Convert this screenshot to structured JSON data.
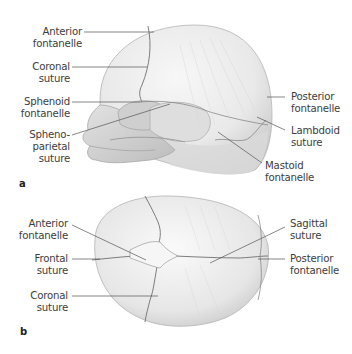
{
  "figure": {
    "panel_a": {
      "letter": "a",
      "view": "lateral view of neonatal skull",
      "labels": [
        {
          "id": "anterior-fontanelle",
          "line1": "Anterior",
          "line2": "fontanelle"
        },
        {
          "id": "coronal-suture",
          "line1": "Coronal",
          "line2": "suture"
        },
        {
          "id": "sphenoid-fontanelle",
          "line1": "Sphenoid",
          "line2": "fontanelle"
        },
        {
          "id": "sphenoparietal-suture",
          "line1": "Spheno-",
          "line2": "parietal",
          "line3": "suture"
        },
        {
          "id": "posterior-fontanelle",
          "line1": "Posterior",
          "line2": "fontanelle"
        },
        {
          "id": "lambdoid-suture",
          "line1": "Lambdoid",
          "line2": "suture"
        },
        {
          "id": "mastoid-fontanelle",
          "line1": "Mastoid",
          "line2": "fontanelle"
        }
      ]
    },
    "panel_b": {
      "letter": "b",
      "view": "superior view of neonatal skull",
      "labels": [
        {
          "id": "anterior-fontanelle",
          "line1": "Anterior",
          "line2": "fontanelle"
        },
        {
          "id": "frontal-suture",
          "line1": "Frontal",
          "line2": "suture"
        },
        {
          "id": "coronal-suture",
          "line1": "Coronal",
          "line2": "suture"
        },
        {
          "id": "sagittal-suture",
          "line1": "Sagittal",
          "line2": "suture"
        },
        {
          "id": "posterior-fontanelle",
          "line1": "Posterior",
          "line2": "fontanelle"
        }
      ]
    },
    "colors": {
      "bone": "#ececec",
      "bone_shadow": "#c9c9c9",
      "suture": "#7a7a7a",
      "leader_line": "#555555",
      "text": "#3d3d3d"
    }
  }
}
